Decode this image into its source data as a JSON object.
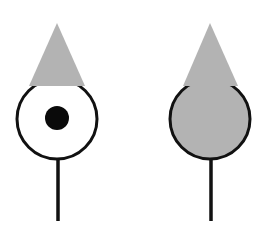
{
  "diagram": {
    "colors": {
      "background": "#ffffff",
      "shape_fill": "#b3b3b3",
      "outline": "#111111",
      "dot": "#0a0a0a"
    },
    "figures": [
      {
        "id": "left",
        "triangle": {
          "apex": [
            57,
            23
          ],
          "base_left": [
            29,
            86
          ],
          "base_right": [
            85,
            86
          ]
        },
        "circle": {
          "cx": 57,
          "cy": 119,
          "r": 40,
          "fill": "#ffffff"
        },
        "dot": {
          "cx": 57,
          "cy": 118,
          "r": 12
        },
        "stem": {
          "x": 58,
          "y1": 159,
          "y2": 221
        }
      },
      {
        "id": "right",
        "triangle": {
          "apex": [
            210,
            23
          ],
          "base_left": [
            183,
            86
          ],
          "base_right": [
            238,
            86
          ]
        },
        "circle": {
          "cx": 210,
          "cy": 119,
          "r": 40,
          "fill": "#b3b3b3"
        },
        "dot": null,
        "stem": {
          "x": 211,
          "y1": 159,
          "y2": 221
        }
      }
    ]
  }
}
